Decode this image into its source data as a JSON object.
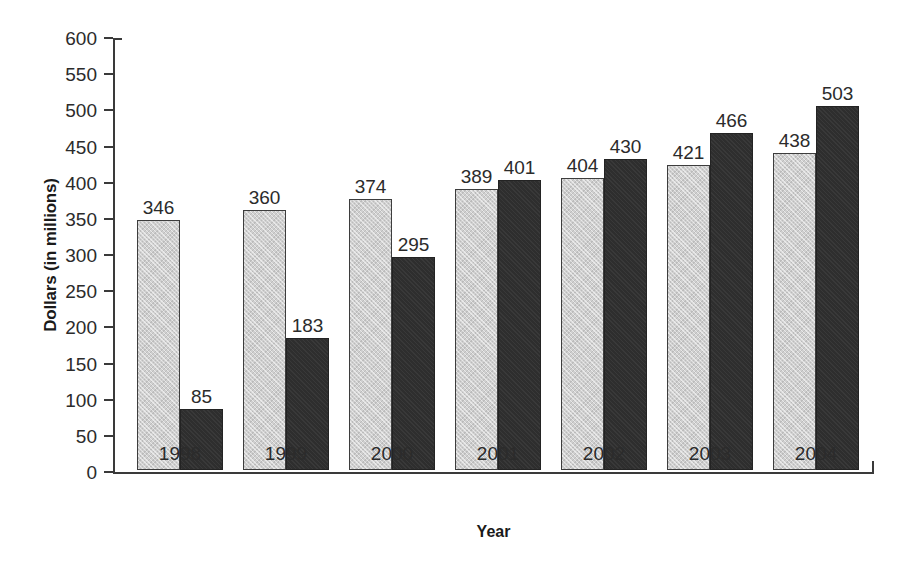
{
  "chart_data": {
    "type": "bar",
    "title": "",
    "xlabel": "Year",
    "ylabel": "Dollars (in millions)",
    "categories": [
      "1998",
      "1999",
      "2000",
      "2001",
      "2002",
      "2003",
      "2004"
    ],
    "series": [
      {
        "name": "light-series",
        "values": [
          346,
          360,
          374,
          389,
          404,
          421,
          438
        ]
      },
      {
        "name": "dark-series",
        "values": [
          85,
          183,
          295,
          401,
          430,
          466,
          503
        ]
      }
    ],
    "ylim": [
      0,
      600
    ],
    "yticks": [
      0,
      50,
      100,
      150,
      200,
      250,
      300,
      350,
      400,
      450,
      500,
      550,
      600
    ],
    "ytick_labels": [
      "0",
      "50",
      "100",
      "150",
      "200",
      "250",
      "300",
      "350",
      "400",
      "450",
      "500",
      "550",
      "600"
    ],
    "grid": false,
    "legend": "none",
    "data_labels": true,
    "colors": {
      "light_series": "#cfcfcf",
      "dark_series": "#2e2e2e",
      "axis": "#3a3a3a",
      "text": "#2b2b2b",
      "background": "#ffffff"
    }
  }
}
